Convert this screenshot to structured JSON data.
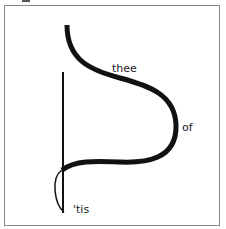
{
  "poem": {
    "words": {
      "w1": "thee",
      "w2": "of",
      "w3": "'tis"
    }
  },
  "colors": {
    "stroke": "#111111",
    "frame": "#8a8a8a",
    "background": "#ffffff"
  }
}
